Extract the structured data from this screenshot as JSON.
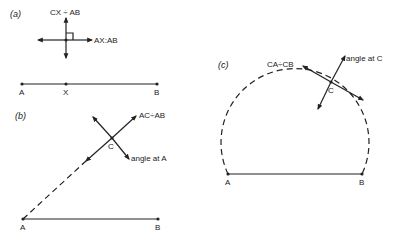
{
  "panels": {
    "a": {
      "label": "(a)",
      "perp_label": "CX ÷ AB",
      "horiz_label": "AX:AB",
      "points": {
        "A": "A",
        "X": "X",
        "B": "B"
      }
    },
    "b": {
      "label": "(b)",
      "ratio_label": "AC÷AB",
      "angle_label": "angle at A",
      "points": {
        "A": "A",
        "B": "B",
        "C": "C"
      }
    },
    "c": {
      "label": "(c)",
      "ratio_label": "CA÷CB",
      "angle_label": "angle at C",
      "points": {
        "A": "A",
        "B": "B",
        "C": "C"
      }
    }
  },
  "colors": {
    "ink": "#222222",
    "background": "#ffffff"
  }
}
